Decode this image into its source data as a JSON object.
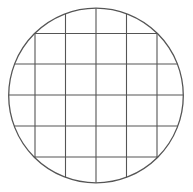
{
  "diagram": {
    "type": "circle-grid",
    "background": "#ffffff",
    "stroke_color": "#555555",
    "circle": {
      "cx": 96,
      "cy": 95.5,
      "r": 87.3,
      "stroke_width": 1.3
    },
    "grid": {
      "stroke_width": 1.1,
      "vertical_x": [
        35,
        65.5,
        96,
        126.5,
        157
      ],
      "horizontal_y": [
        33.5,
        64,
        95,
        126,
        157
      ]
    }
  }
}
